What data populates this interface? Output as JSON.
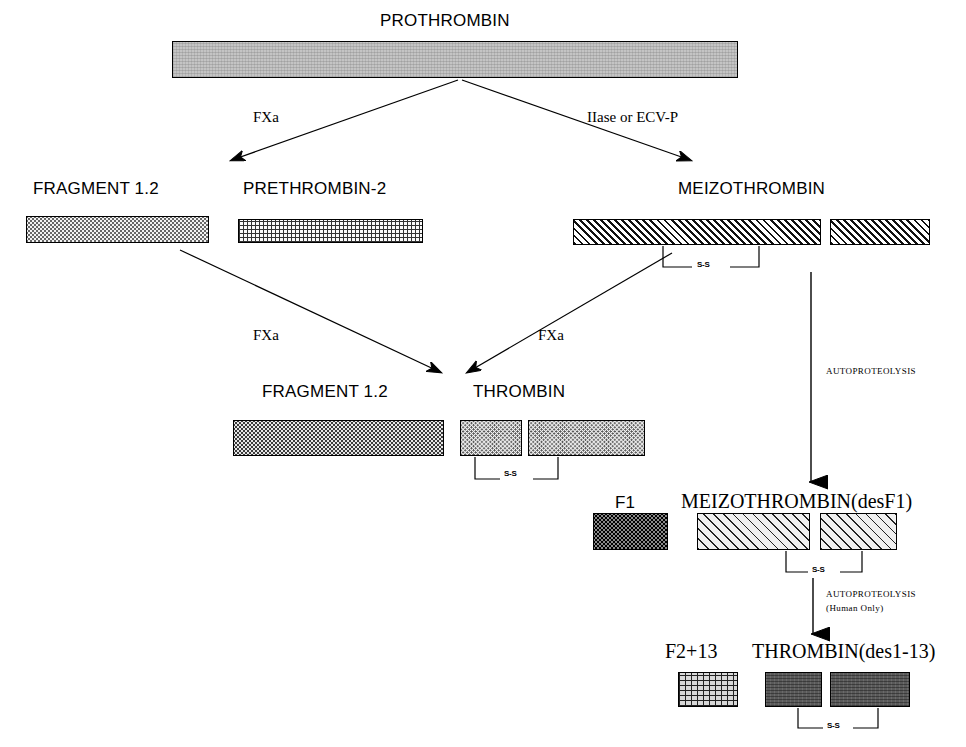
{
  "diagram": {
    "nodes": [
      {
        "id": "prothrombin",
        "label": "PROTHROMBIN",
        "style": "sans"
      },
      {
        "id": "fragment12-top",
        "label": "FRAGMENT 1.2",
        "style": "sans"
      },
      {
        "id": "prethrombin2",
        "label": "PRETHROMBIN-2",
        "style": "sans"
      },
      {
        "id": "meizothrombin",
        "label": "MEIZOTHROMBIN",
        "style": "sans"
      },
      {
        "id": "fragment12-mid",
        "label": "FRAGMENT 1.2",
        "style": "sans"
      },
      {
        "id": "thrombin",
        "label": "THROMBIN",
        "style": "sans"
      },
      {
        "id": "f1",
        "label": "F1",
        "style": "sans"
      },
      {
        "id": "meizothrombin-desf1",
        "label": "MEIZOTHROMBIN(desF1)",
        "style": "serif"
      },
      {
        "id": "f2-13",
        "label": "F2+13",
        "style": "serif"
      },
      {
        "id": "thrombin-des1-13",
        "label": "THROMBIN(des1-13)",
        "style": "serif"
      }
    ],
    "edge_labels": [
      {
        "id": "fxa-top-left",
        "text": "FXa"
      },
      {
        "id": "iiase-ecvp",
        "text": "IIase or ECV-P"
      },
      {
        "id": "fxa-mid-left",
        "text": "FXa"
      },
      {
        "id": "fxa-mid-right",
        "text": "FXa"
      },
      {
        "id": "autoproteolysis-1",
        "text": "AUTOPROTEOLYSIS"
      },
      {
        "id": "autoproteolysis-2",
        "text": "AUTOPROTEOLYSIS"
      },
      {
        "id": "autoproteolysis-2-note",
        "text": "(Human Only)"
      }
    ],
    "disulfide_bonds": [
      {
        "id": "ss-meizothrombin",
        "text": "S-S"
      },
      {
        "id": "ss-thrombin",
        "text": "S-S"
      },
      {
        "id": "ss-meizothrombin-desf1",
        "text": "S-S"
      },
      {
        "id": "ss-thrombin-des1-13",
        "text": "S-S"
      }
    ],
    "colors": {
      "stroke": "#000000",
      "background": "#ffffff",
      "prothrombin_fill": "#c4c4c4",
      "dark_fill": "#5a5a5a"
    }
  }
}
